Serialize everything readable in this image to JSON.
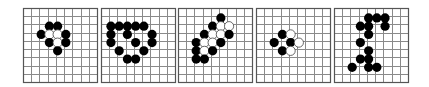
{
  "figure": {
    "description": "Five Go board diagrams showing stone patterns",
    "colors": {
      "background": "#ffffff",
      "grid_line": "#8a8a8a",
      "frame": "#555555",
      "black_stone": "#000000",
      "white_stone_fill": "#ffffff",
      "white_stone_stroke": "#444444"
    },
    "grid": {
      "lines": 10,
      "spacing_px": 8.2,
      "board_size_px": 74
    },
    "boards": [
      {
        "id": "board-1",
        "left": 23,
        "top": 8,
        "stones": [
          {
            "color": "black",
            "col": 3,
            "row": 2
          },
          {
            "color": "black",
            "col": 4,
            "row": 2
          },
          {
            "color": "black",
            "col": 2,
            "row": 3
          },
          {
            "color": "white",
            "col": 3,
            "row": 3
          },
          {
            "color": "white",
            "col": 4,
            "row": 3
          },
          {
            "color": "black",
            "col": 5,
            "row": 3
          },
          {
            "color": "black",
            "col": 3,
            "row": 4
          },
          {
            "color": "white",
            "col": 4,
            "row": 4
          },
          {
            "color": "black",
            "col": 5,
            "row": 4
          },
          {
            "color": "black",
            "col": 4,
            "row": 5
          }
        ]
      },
      {
        "id": "board-2",
        "left": 101,
        "top": 8,
        "stones": [
          {
            "color": "black",
            "col": 1,
            "row": 2
          },
          {
            "color": "black",
            "col": 2,
            "row": 2
          },
          {
            "color": "black",
            "col": 3,
            "row": 2
          },
          {
            "color": "black",
            "col": 4,
            "row": 2
          },
          {
            "color": "black",
            "col": 5,
            "row": 2
          },
          {
            "color": "black",
            "col": 1,
            "row": 3
          },
          {
            "color": "black",
            "col": 3,
            "row": 3
          },
          {
            "color": "black",
            "col": 6,
            "row": 3
          },
          {
            "color": "black",
            "col": 1,
            "row": 4
          },
          {
            "color": "black",
            "col": 4,
            "row": 4
          },
          {
            "color": "black",
            "col": 6,
            "row": 4
          },
          {
            "color": "black",
            "col": 2,
            "row": 5
          },
          {
            "color": "black",
            "col": 5,
            "row": 5
          },
          {
            "color": "black",
            "col": 3,
            "row": 6
          },
          {
            "color": "black",
            "col": 4,
            "row": 6
          }
        ]
      },
      {
        "id": "board-3",
        "left": 178,
        "top": 8,
        "stones": [
          {
            "color": "black",
            "col": 5,
            "row": 1
          },
          {
            "color": "black",
            "col": 4,
            "row": 2
          },
          {
            "color": "white",
            "col": 5,
            "row": 2
          },
          {
            "color": "white",
            "col": 6,
            "row": 2
          },
          {
            "color": "black",
            "col": 3,
            "row": 3
          },
          {
            "color": "white",
            "col": 4,
            "row": 3
          },
          {
            "color": "white",
            "col": 5,
            "row": 3
          },
          {
            "color": "black",
            "col": 6,
            "row": 3
          },
          {
            "color": "black",
            "col": 2,
            "row": 4
          },
          {
            "color": "white",
            "col": 3,
            "row": 4
          },
          {
            "color": "white",
            "col": 4,
            "row": 4
          },
          {
            "color": "black",
            "col": 5,
            "row": 4
          },
          {
            "color": "black",
            "col": 2,
            "row": 5
          },
          {
            "color": "white",
            "col": 3,
            "row": 5
          },
          {
            "color": "black",
            "col": 4,
            "row": 5
          },
          {
            "color": "black",
            "col": 2,
            "row": 6
          },
          {
            "color": "black",
            "col": 3,
            "row": 6
          }
        ]
      },
      {
        "id": "board-4",
        "left": 256,
        "top": 8,
        "stones": [
          {
            "color": "black",
            "col": 3,
            "row": 3
          },
          {
            "color": "white",
            "col": 4,
            "row": 3
          },
          {
            "color": "black",
            "col": 2,
            "row": 4
          },
          {
            "color": "black",
            "col": 4,
            "row": 4
          },
          {
            "color": "white",
            "col": 5,
            "row": 4
          },
          {
            "color": "black",
            "col": 3,
            "row": 5
          },
          {
            "color": "white",
            "col": 4,
            "row": 5
          }
        ]
      },
      {
        "id": "board-5",
        "left": 334,
        "top": 8,
        "stones": [
          {
            "color": "black",
            "col": 4,
            "row": 1
          },
          {
            "color": "black",
            "col": 5,
            "row": 1
          },
          {
            "color": "black",
            "col": 6,
            "row": 1
          },
          {
            "color": "black",
            "col": 3,
            "row": 2
          },
          {
            "color": "black",
            "col": 4,
            "row": 2
          },
          {
            "color": "black",
            "col": 6,
            "row": 2
          },
          {
            "color": "black",
            "col": 4,
            "row": 3
          },
          {
            "color": "black",
            "col": 3,
            "row": 4
          },
          {
            "color": "black",
            "col": 4,
            "row": 5
          },
          {
            "color": "black",
            "col": 3,
            "row": 6
          },
          {
            "color": "black",
            "col": 4,
            "row": 6
          },
          {
            "color": "black",
            "col": 2,
            "row": 7
          },
          {
            "color": "black",
            "col": 4,
            "row": 7
          },
          {
            "color": "black",
            "col": 5,
            "row": 7
          }
        ]
      }
    ]
  }
}
